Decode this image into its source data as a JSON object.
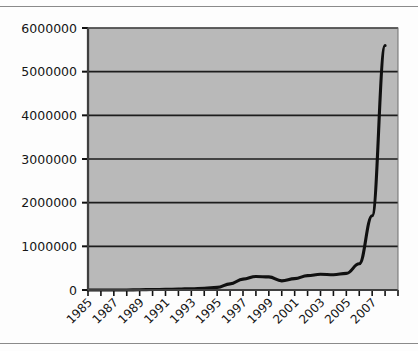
{
  "chart_data": {
    "type": "line",
    "title": "",
    "subtitle": "",
    "xlabel": "",
    "ylabel": "",
    "grid": true,
    "legend": false,
    "legend_position": "none",
    "xlim": [
      1985,
      2009
    ],
    "ylim": [
      0,
      6000000
    ],
    "x_tick_labels": [
      "1985",
      "1987",
      "1989",
      "1991",
      "1993",
      "1995",
      "1997",
      "1999",
      "2001",
      "2003",
      "2005",
      "2007"
    ],
    "x_tick_values": [
      1985,
      1987,
      1989,
      1991,
      1993,
      1995,
      1997,
      1999,
      2001,
      2003,
      2005,
      2007
    ],
    "x_minor_ticks_every": 1,
    "y_tick_labels": [
      "0",
      "1000000",
      "2000000",
      "3000000",
      "4000000",
      "5000000",
      "6000000"
    ],
    "y_tick_values": [
      0,
      1000000,
      2000000,
      3000000,
      4000000,
      5000000,
      6000000
    ],
    "x": [
      1985,
      1986,
      1987,
      1988,
      1989,
      1990,
      1991,
      1992,
      1993,
      1994,
      1995,
      1996,
      1997,
      1998,
      1999,
      2000,
      2001,
      2002,
      2003,
      2004,
      2005,
      2006,
      2007,
      2008
    ],
    "values": [
      0,
      0,
      0,
      0,
      5000,
      10000,
      15000,
      20000,
      30000,
      40000,
      60000,
      140000,
      250000,
      310000,
      300000,
      210000,
      260000,
      330000,
      360000,
      350000,
      380000,
      600000,
      1700000,
      5600000
    ],
    "series": [
      {
        "name": "series-1",
        "color": "#101010",
        "values": [
          0,
          0,
          0,
          0,
          5000,
          10000,
          15000,
          20000,
          30000,
          40000,
          60000,
          140000,
          250000,
          310000,
          300000,
          210000,
          260000,
          330000,
          360000,
          350000,
          380000,
          600000,
          1700000,
          5600000
        ]
      }
    ],
    "annotations": []
  },
  "style": {
    "plot_background": "#b9b9b9",
    "grid_color": "#1d1d1d",
    "axis_color": "#111111",
    "line_color": "#101010",
    "page_background": "#fdfdfd",
    "rule_color": "#8a8a8a"
  }
}
